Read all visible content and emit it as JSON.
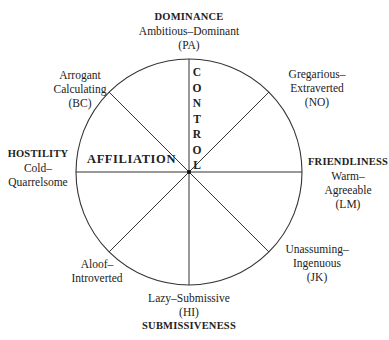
{
  "diagram": {
    "type": "interpersonal-circumplex",
    "axes": {
      "vertical": "CONTROL",
      "horizontal": "AFFILIATION"
    },
    "octants": [
      {
        "id": "PA",
        "pole": "DOMINANCE",
        "name": "Ambitious–Dominant",
        "code": "(PA)"
      },
      {
        "id": "NO",
        "name_line1": "Gregarious–",
        "name_line2": "Extraverted",
        "code": "(NO)"
      },
      {
        "id": "LM",
        "pole": "FRIENDLINESS",
        "name_line1": "Warm–",
        "name_line2": "Agreeable",
        "code": "(LM)"
      },
      {
        "id": "JK",
        "name_line1": "Unassuming–",
        "name_line2": "Ingenuous",
        "code": "(JK)"
      },
      {
        "id": "HI",
        "pole": "SUBMISSIVENESS",
        "name": "Lazy–Submissive",
        "code": "(HI)"
      },
      {
        "id": "FG",
        "name_line1": "Aloof–",
        "name_line2": "Introverted"
      },
      {
        "id": "DE",
        "pole": "HOSTILITY",
        "name_line1": "Cold–",
        "name_line2": "Quarrelsome"
      },
      {
        "id": "BC",
        "name_line1": "Arrogant",
        "name_line2": "Calculating",
        "code": "(BC)"
      }
    ],
    "control_letters": [
      "C",
      "O",
      "N",
      "T",
      "R",
      "O",
      "L"
    ]
  }
}
